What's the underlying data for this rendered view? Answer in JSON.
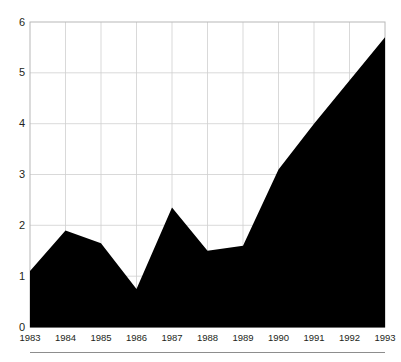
{
  "chart_data": {
    "type": "area",
    "title": "",
    "subtitle": "",
    "xlabel": "",
    "ylabel": "",
    "categories": [
      "1983",
      "1984",
      "1985",
      "1986",
      "1987",
      "1988",
      "1989",
      "1990",
      "1991",
      "1992",
      "1993"
    ],
    "values": [
      1.1,
      1.9,
      1.65,
      0.75,
      2.35,
      1.5,
      1.6,
      3.1,
      4.0,
      4.85,
      5.7
    ],
    "series": [
      {
        "name": "",
        "values": [
          1.1,
          1.9,
          1.65,
          0.75,
          2.35,
          1.5,
          1.6,
          3.1,
          4.0,
          4.85,
          5.7
        ]
      }
    ],
    "ylim": [
      0,
      6
    ],
    "yticks": [
      "0",
      "1",
      "2",
      "3",
      "4",
      "5",
      "6"
    ],
    "ytick_values": [
      0,
      1,
      2,
      3,
      4,
      5,
      6
    ],
    "xticks": [
      "1983",
      "1984",
      "1985",
      "1986",
      "1987",
      "1988",
      "1989",
      "1990",
      "1991",
      "1992",
      "1993"
    ],
    "grid": true,
    "grid_color": "#cfcfcf",
    "legend": null,
    "legend_position": "none",
    "area_color": "#000000",
    "background_color": "#ffffff",
    "annotations": []
  },
  "axes": {
    "y_tick_labels": [
      "6",
      "5",
      "4",
      "3",
      "2",
      "1",
      "0"
    ],
    "x_tick_labels": [
      "1983",
      "1984",
      "1985",
      "1986",
      "1987",
      "1988",
      "1989",
      "1990",
      "1991",
      "1992",
      "1993"
    ]
  },
  "page": {
    "top_clipped_text": "",
    "footer_clipped_text": ""
  }
}
